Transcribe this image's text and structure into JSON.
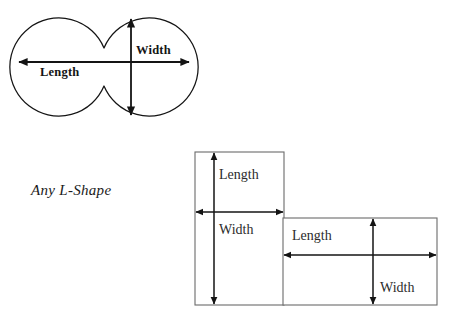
{
  "figure": {
    "caption": "Any L-Shape",
    "background_color": "#ffffff",
    "outline_color": "#141414",
    "rect_stroke_color": "#6b6b6b",
    "arrow_color": "#141414",
    "shapes": [
      {
        "name": "peanut-shape",
        "type": "two-overlapping-circles",
        "labels": {
          "length": "Length",
          "width": "Width"
        },
        "geometry": {
          "circle_left_center": [
            67,
            67
          ],
          "circle_right_center": [
            141,
            67
          ],
          "radius": 49,
          "bounds": [
            18,
            18,
            190,
            116
          ]
        },
        "dimension_arrows": [
          {
            "name": "length-arrow",
            "orientation": "horizontal",
            "from": [
              19,
              62
            ],
            "to": [
              189,
              62
            ],
            "double_headed": true
          },
          {
            "name": "width-arrow",
            "orientation": "vertical",
            "from": [
              131,
              19
            ],
            "to": [
              131,
              115
            ],
            "double_headed": true
          }
        ]
      },
      {
        "name": "l-shape",
        "type": "two-rectangles",
        "rectangles": [
          {
            "name": "tall-rectangle",
            "bounds": [
              195,
              152,
              284,
              305
            ],
            "labels": {
              "length": "Length",
              "width": "Width"
            },
            "dimension_arrows": [
              {
                "name": "vertical-arrow",
                "orientation": "vertical",
                "from": [
                  214,
                  153
                ],
                "to": [
                  214,
                  304
                ],
                "double_headed": true
              },
              {
                "name": "horizontal-arrow",
                "orientation": "horizontal",
                "from": [
                  196,
                  212
                ],
                "to": [
                  283,
                  212
                ],
                "double_headed": true
              }
            ]
          },
          {
            "name": "wide-rectangle",
            "bounds": [
              283,
              218,
              437,
              305
            ],
            "labels": {
              "length": "Length",
              "width": "Width"
            },
            "dimension_arrows": [
              {
                "name": "vertical-arrow",
                "orientation": "vertical",
                "from": [
                  373,
                  219
                ],
                "to": [
                  373,
                  304
                ],
                "double_headed": true
              },
              {
                "name": "horizontal-arrow",
                "orientation": "horizontal",
                "from": [
                  284,
                  255
                ],
                "to": [
                  436,
                  255
                ],
                "double_headed": true
              }
            ]
          }
        ]
      }
    ]
  }
}
